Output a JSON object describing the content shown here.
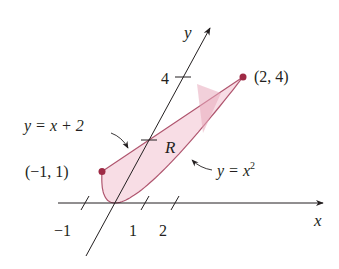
{
  "figure": {
    "type": "region-diagram",
    "axes": {
      "x_label": "x",
      "y_label": "y",
      "x_ticks": [
        {
          "value": -1,
          "label": "−1"
        },
        {
          "value": 1,
          "label": "1"
        },
        {
          "value": 2,
          "label": "2"
        }
      ],
      "y_ticks": [
        {
          "value": 2,
          "label": ""
        },
        {
          "value": 4,
          "label": "4"
        }
      ]
    },
    "curves": {
      "upper": {
        "equation": "y = x + 2",
        "label_prefix": "y = x + 2"
      },
      "lower": {
        "equation": "y = x^2",
        "label_base": "y = x",
        "label_exp": "2"
      }
    },
    "region_label": "R",
    "points": [
      {
        "x": -1,
        "y": 1,
        "label": "(−1, 1)"
      },
      {
        "x": 2,
        "y": 4,
        "label": "(2, 4)"
      }
    ],
    "colors": {
      "region_fill": "#f7d9e2",
      "region_stroke": "#b0566f",
      "point": "#9e2a45",
      "axis": "#231f20",
      "shadow": "#e8aabb"
    }
  }
}
